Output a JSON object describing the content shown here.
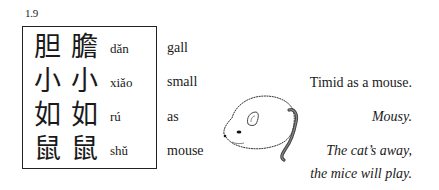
{
  "figure_number": "1.9",
  "rows": [
    {
      "traditional": "胆",
      "simplified": "膽",
      "pinyin": "dǎn",
      "gloss": "gall"
    },
    {
      "traditional": "小",
      "simplified": "小",
      "pinyin": "xiǎo",
      "gloss": "small"
    },
    {
      "traditional": "如",
      "simplified": "如",
      "pinyin": "rú",
      "gloss": "as"
    },
    {
      "traditional": "鼠",
      "simplified": "鼠",
      "pinyin": "shǔ",
      "gloss": "mouse"
    }
  ],
  "translations": {
    "literal": "Timid as a mouse.",
    "idiomatic": "Mousy.",
    "proverb_line1": "The cat’s away,",
    "proverb_line2": "the mice will play."
  },
  "illustration": {
    "icon": "mouse-illustration"
  }
}
